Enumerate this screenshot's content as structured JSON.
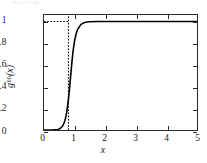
{
  "figure": {
    "caption_fragment": "10.10.1  100",
    "background": "#ffffff",
    "frame_color": "#2b2b2b"
  },
  "chart_data": {
    "type": "line",
    "title": "",
    "subtitle": "",
    "xlabel": "x",
    "ylabel": "g10(x)",
    "ylabel_base": "g",
    "ylabel_sub": "10",
    "ylabel_arg": "(x)",
    "xlim": [
      0,
      5
    ],
    "ylim": [
      0,
      1.06
    ],
    "xticks": [
      0,
      1,
      2,
      3,
      4,
      5
    ],
    "xticklabels": [
      "0",
      "1",
      "2",
      "3",
      "4",
      "5"
    ],
    "yticks": [
      0,
      0.2,
      0.4,
      0.6,
      0.8,
      1
    ],
    "yticklabels": [
      "0",
      "0.2",
      "0.4",
      "0.6",
      "0.8",
      "1"
    ],
    "grid": false,
    "legend": null,
    "series": [
      {
        "name": "g10(x)",
        "style": "solid",
        "color": "#000000",
        "width": 1.6,
        "x": [
          0.0,
          0.1,
          0.2,
          0.25,
          0.3,
          0.35,
          0.4,
          0.45,
          0.5,
          0.55,
          0.58,
          0.6,
          0.62,
          0.64,
          0.66,
          0.68,
          0.7,
          0.72,
          0.74,
          0.76,
          0.78,
          0.8,
          0.82,
          0.84,
          0.86,
          0.88,
          0.9,
          0.92,
          0.95,
          1.0,
          1.05,
          1.1,
          1.2,
          1.3,
          1.4,
          1.5,
          1.75,
          2.0,
          2.5,
          3.0,
          3.5,
          4.0,
          4.5,
          5.0
        ],
        "y": [
          0.0,
          0.0,
          0.0,
          0.0,
          0.0,
          0.001,
          0.002,
          0.005,
          0.01,
          0.02,
          0.028,
          0.035,
          0.044,
          0.055,
          0.069,
          0.086,
          0.107,
          0.132,
          0.163,
          0.199,
          0.241,
          0.289,
          0.343,
          0.402,
          0.464,
          0.527,
          0.589,
          0.648,
          0.727,
          0.824,
          0.888,
          0.928,
          0.971,
          0.988,
          0.995,
          0.998,
          1.0,
          1.0,
          1.0,
          1.0,
          1.0,
          1.0,
          1.0,
          1.0
        ]
      }
    ],
    "reference_lines": [
      {
        "name": "vertical-dotted-marker",
        "orientation": "vertical",
        "x": 0.8,
        "y_from": 0.0,
        "y_to": 1.06,
        "style": "dotted",
        "color": "#000000"
      },
      {
        "name": "horizontal-dotted-asymptote",
        "orientation": "horizontal",
        "y": 1.0,
        "x_from": 0.0,
        "x_to": 0.8,
        "style": "dotted",
        "color": "#000000"
      }
    ]
  }
}
